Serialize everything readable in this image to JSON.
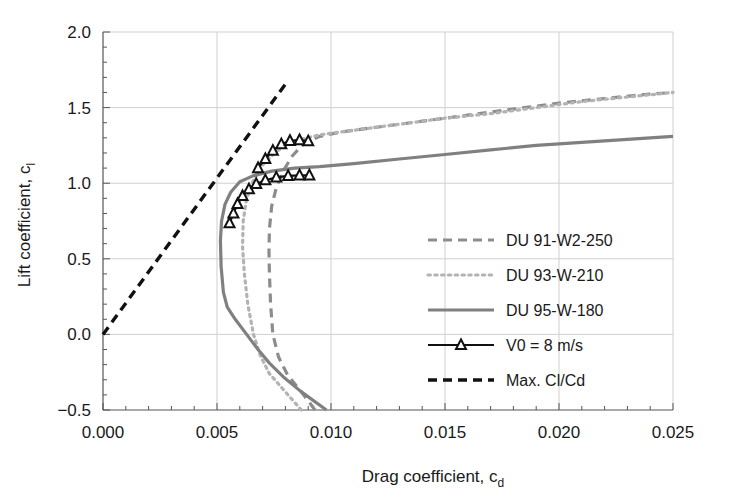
{
  "chart_data": {
    "type": "line",
    "title": "",
    "xlabel": "Drag coefficient, c_d",
    "xlabel_main": "Drag coefficient, c",
    "xlabel_sub": "d",
    "ylabel_main": "Lift coefficient, c",
    "ylabel_sub": "l",
    "ylabel": "Lift coefficient, c_l",
    "xlim": [
      0.0,
      0.025
    ],
    "ylim": [
      -0.5,
      2.0
    ],
    "xticks": [
      0.0,
      0.005,
      0.01,
      0.015,
      0.02,
      0.025
    ],
    "xtick_labels": [
      "0.000",
      "0.005",
      "0.010",
      "0.015",
      "0.020",
      "0.025"
    ],
    "yticks": [
      -0.5,
      0.0,
      0.5,
      1.0,
      1.5,
      2.0
    ],
    "ytick_labels": [
      "−0.5",
      "0.0",
      "0.5",
      "1.0",
      "1.5",
      "2.0"
    ],
    "grid": true,
    "minor_ticks": true,
    "legend_position": "center-right",
    "series": [
      {
        "name": "DU 91-W2-250",
        "style": "dashed",
        "color": "#8c8c8c",
        "points": [
          [
            0.0093,
            -0.5
          ],
          [
            0.0087,
            -0.38
          ],
          [
            0.0081,
            -0.27
          ],
          [
            0.0077,
            -0.15
          ],
          [
            0.00745,
            0.0
          ],
          [
            0.00735,
            0.2
          ],
          [
            0.0073,
            0.4
          ],
          [
            0.00728,
            0.55
          ],
          [
            0.0073,
            0.7
          ],
          [
            0.0074,
            0.85
          ],
          [
            0.0076,
            0.97
          ],
          [
            0.0079,
            1.08
          ],
          [
            0.0083,
            1.18
          ],
          [
            0.0088,
            1.26
          ],
          [
            0.0095,
            1.31
          ],
          [
            0.0105,
            1.34
          ],
          [
            0.012,
            1.37
          ],
          [
            0.014,
            1.41
          ],
          [
            0.016,
            1.45
          ],
          [
            0.018,
            1.49
          ],
          [
            0.02,
            1.53
          ],
          [
            0.022,
            1.56
          ],
          [
            0.024,
            1.59
          ],
          [
            0.025,
            1.6
          ]
        ]
      },
      {
        "name": "DU 93-W-210",
        "style": "dotted",
        "color": "#b3b3b3",
        "points": [
          [
            0.0087,
            -0.5
          ],
          [
            0.008,
            -0.38
          ],
          [
            0.0073,
            -0.26
          ],
          [
            0.0069,
            -0.14
          ],
          [
            0.0066,
            0.0
          ],
          [
            0.00635,
            0.2
          ],
          [
            0.0062,
            0.4
          ],
          [
            0.00612,
            0.58
          ],
          [
            0.00615,
            0.75
          ],
          [
            0.0063,
            0.9
          ],
          [
            0.0066,
            1.02
          ],
          [
            0.007,
            1.12
          ],
          [
            0.0076,
            1.21
          ],
          [
            0.0084,
            1.28
          ],
          [
            0.0095,
            1.32
          ],
          [
            0.011,
            1.35
          ],
          [
            0.013,
            1.39
          ],
          [
            0.015,
            1.43
          ],
          [
            0.017,
            1.46
          ],
          [
            0.019,
            1.5
          ],
          [
            0.021,
            1.54
          ],
          [
            0.023,
            1.57
          ],
          [
            0.025,
            1.6
          ]
        ]
      },
      {
        "name": "DU 95-W-180",
        "style": "solid",
        "color": "#808080",
        "points": [
          [
            0.0098,
            -0.5
          ],
          [
            0.0087,
            -0.38
          ],
          [
            0.0079,
            -0.28
          ],
          [
            0.0073,
            -0.19
          ],
          [
            0.0068,
            -0.1
          ],
          [
            0.0063,
            0.0
          ],
          [
            0.0058,
            0.1
          ],
          [
            0.00545,
            0.18
          ],
          [
            0.00528,
            0.28
          ],
          [
            0.00518,
            0.45
          ],
          [
            0.00515,
            0.62
          ],
          [
            0.0052,
            0.75
          ],
          [
            0.00535,
            0.86
          ],
          [
            0.0056,
            0.94
          ],
          [
            0.006,
            1.01
          ],
          [
            0.0066,
            1.05
          ],
          [
            0.0074,
            1.08
          ],
          [
            0.0084,
            1.1
          ],
          [
            0.0095,
            1.11
          ],
          [
            0.011,
            1.13
          ],
          [
            0.013,
            1.16
          ],
          [
            0.015,
            1.19
          ],
          [
            0.017,
            1.22
          ],
          [
            0.019,
            1.25
          ],
          [
            0.021,
            1.27
          ],
          [
            0.023,
            1.29
          ],
          [
            0.025,
            1.31
          ]
        ]
      },
      {
        "name": "V0 = 8 m/s",
        "style": "solid-marker",
        "color": "#111111",
        "marker": "triangle-up",
        "branches": [
          [
            [
              0.00555,
              0.735
            ],
            [
              0.00572,
              0.8
            ],
            [
              0.0059,
              0.862
            ],
            [
              0.00612,
              0.915
            ],
            [
              0.0064,
              0.96
            ],
            [
              0.00672,
              0.995
            ],
            [
              0.00712,
              1.02
            ],
            [
              0.0076,
              1.038
            ],
            [
              0.00812,
              1.048
            ],
            [
              0.00862,
              1.052
            ],
            [
              0.00905,
              1.052
            ]
          ],
          [
            [
              0.0068,
              1.1
            ],
            [
              0.00712,
              1.16
            ],
            [
              0.00745,
              1.215
            ],
            [
              0.00782,
              1.258
            ],
            [
              0.0082,
              1.28
            ],
            [
              0.00862,
              1.285
            ],
            [
              0.009,
              1.278
            ]
          ]
        ]
      },
      {
        "name": "Max. Cl/Cd",
        "style": "dashed-black",
        "color": "#111111",
        "points": [
          [
            0.0,
            0.0
          ],
          [
            0.008,
            1.655
          ]
        ]
      }
    ],
    "legend": [
      {
        "label": "DU 91-W2-250",
        "style": "dashed",
        "color": "#8c8c8c"
      },
      {
        "label": "DU 93-W-210",
        "style": "dotted",
        "color": "#b3b3b3"
      },
      {
        "label": "DU 95-W-180",
        "style": "solid",
        "color": "#808080"
      },
      {
        "label": "V0 = 8 m/s",
        "style": "solid-marker",
        "color": "#111111"
      },
      {
        "label": "Max. Cl/Cd",
        "style": "dashed-black",
        "color": "#111111"
      }
    ]
  }
}
